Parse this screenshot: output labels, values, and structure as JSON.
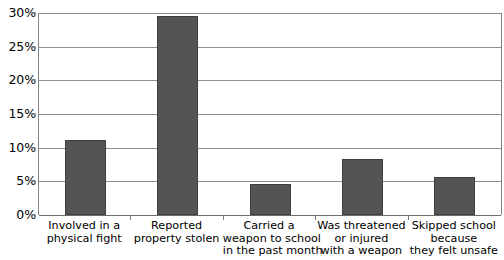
{
  "chart_data": {
    "type": "bar",
    "title": "",
    "subtitle": "",
    "xlabel": "",
    "ylabel": "",
    "ylim": [
      0,
      30
    ],
    "y_unit": "%",
    "grid": true,
    "legend": false,
    "legend_position": "none",
    "bar_color": "#545454",
    "bar_border_color": "#3f3f3f",
    "gridline_color": "#8c8c8c",
    "axis_color": "#848484",
    "text_color": "#000000",
    "background_color": "#ffffff",
    "y_ticks": [
      {
        "value": 0,
        "label": "0%"
      },
      {
        "value": 5,
        "label": "5%"
      },
      {
        "value": 10,
        "label": "10%"
      },
      {
        "value": 15,
        "label": "15%"
      },
      {
        "value": 20,
        "label": "20%"
      },
      {
        "value": 25,
        "label": "25%"
      },
      {
        "value": 30,
        "label": "30%"
      }
    ],
    "categories": [
      "Involved in a physical fight",
      "Reported property stolen",
      "Carried a weapon to school in the past month",
      "Was threatened or injured with a weapon",
      "Skipped school because they felt unsafe"
    ],
    "category_label_lines": [
      [
        "Involved in a",
        "physical fight"
      ],
      [
        "Reported",
        "property stolen"
      ],
      [
        "Carried a",
        "weapon to school",
        "in the past month"
      ],
      [
        "Was threatened",
        "or injured",
        "with a weapon"
      ],
      [
        "Skipped school",
        "because",
        "they felt unsafe"
      ]
    ],
    "values": [
      11.2,
      29.5,
      4.6,
      8.3,
      5.6
    ],
    "value_labels": [
      "11.2%",
      "29.5%",
      "4.6%",
      "8.3%",
      "5.6%"
    ],
    "series": [
      {
        "name": "Percent of students",
        "values": [
          11.2,
          29.5,
          4.6,
          8.3,
          5.6
        ]
      }
    ]
  }
}
